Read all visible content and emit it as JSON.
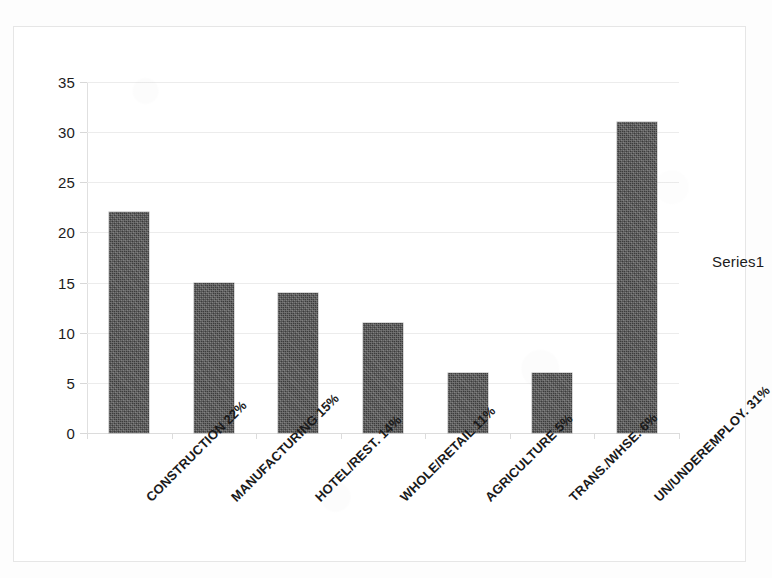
{
  "chart_data": {
    "type": "bar",
    "title": "",
    "xlabel": "",
    "ylabel": "",
    "ylim": [
      0,
      35
    ],
    "ytick_step": 5,
    "yticks": [
      35,
      30,
      25,
      20,
      15,
      10,
      5,
      0
    ],
    "grid": true,
    "legend_position": "right",
    "series": [
      {
        "name": "Series1",
        "values": [
          22,
          15,
          14,
          11,
          6,
          6,
          31
        ]
      }
    ],
    "categories": [
      "CONSTRUCTION 22%",
      "MANUFACTURING 15%",
      "HOTEL/REST. 14%",
      "WHOLE/RETAIL 11%",
      "AGRICULTURE 5%",
      "TRANS./WHSE. 6%",
      "UN/UNDEREMPLOY. 31%"
    ],
    "bar_color": "#3c3c3c",
    "gridline_color": "#ececec",
    "background_color": "#ffffff",
    "label_rotation_deg": -45
  },
  "legend": {
    "entries": [
      {
        "label": "Series1"
      }
    ]
  }
}
